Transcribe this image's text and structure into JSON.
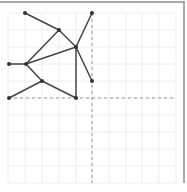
{
  "diagram": {
    "type": "graph",
    "colors": {
      "grid": "#eeeeee",
      "edge": "#444444",
      "node": "#333333",
      "axis_dashed": "#999999",
      "frame": "#a9a9a9"
    },
    "grid": {
      "x": [
        8,
        25,
        42,
        59,
        76,
        92,
        109,
        126,
        142,
        159,
        176
      ],
      "y": [
        13,
        30,
        47,
        64,
        81,
        98,
        115,
        132,
        149,
        166,
        183
      ]
    },
    "axes": {
      "vertical_x": 92,
      "horizontal_y": 98
    },
    "nodes": [
      {
        "id": "n1",
        "x": 25,
        "y": 13
      },
      {
        "id": "n2",
        "x": 92,
        "y": 13
      },
      {
        "id": "n3",
        "x": 59,
        "y": 30
      },
      {
        "id": "n4",
        "x": 76,
        "y": 47
      },
      {
        "id": "n5",
        "x": 9,
        "y": 64
      },
      {
        "id": "n6",
        "x": 26,
        "y": 64
      },
      {
        "id": "n7",
        "x": 42,
        "y": 81
      },
      {
        "id": "n8",
        "x": 92,
        "y": 81
      },
      {
        "id": "n9",
        "x": 9,
        "y": 98
      },
      {
        "id": "n10",
        "x": 76,
        "y": 98
      }
    ],
    "edges": [
      [
        "n1",
        "n3"
      ],
      [
        "n3",
        "n4"
      ],
      [
        "n2",
        "n4"
      ],
      [
        "n4",
        "n8"
      ],
      [
        "n4",
        "n10"
      ],
      [
        "n6",
        "n3"
      ],
      [
        "n6",
        "n4"
      ],
      [
        "n5",
        "n6"
      ],
      [
        "n6",
        "n7"
      ],
      [
        "n7",
        "n9"
      ],
      [
        "n7",
        "n10"
      ]
    ]
  }
}
